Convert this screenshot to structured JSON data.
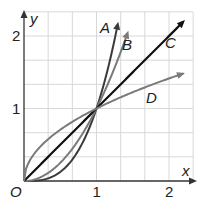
{
  "chart_data": {
    "type": "line",
    "title": "",
    "xlabel": "x",
    "ylabel": "y",
    "origin_label": "O",
    "xlim": [
      0,
      2.3
    ],
    "ylim": [
      0,
      2.33
    ],
    "x_ticks": [
      {
        "value": 1,
        "label": "1"
      },
      {
        "value": 2,
        "label": "2"
      }
    ],
    "y_ticks": [
      {
        "value": 1,
        "label": "1"
      },
      {
        "value": 2,
        "label": "2"
      }
    ],
    "grid": true,
    "grid_step": 0.3333,
    "series": [
      {
        "name": "A",
        "function": "y = x^3",
        "color": "#3a3a3a",
        "x_end": 1.3,
        "points": [
          [
            0,
            0
          ],
          [
            0.5,
            0.125
          ],
          [
            1,
            1
          ],
          [
            1.3,
            2.2
          ]
        ]
      },
      {
        "name": "B",
        "function": "y = x^2",
        "color": "#7a7a7a",
        "x_end": 1.44,
        "points": [
          [
            0,
            0
          ],
          [
            0.5,
            0.25
          ],
          [
            1,
            1
          ],
          [
            1.44,
            2.07
          ]
        ]
      },
      {
        "name": "C",
        "function": "y = x",
        "color": "#111111",
        "x_end": 2.22,
        "points": [
          [
            0,
            0
          ],
          [
            1,
            1
          ],
          [
            2.22,
            2.22
          ]
        ]
      },
      {
        "name": "D",
        "function": "y = sqrt(x)",
        "color": "#7a7a7a",
        "x_end": 2.22,
        "points": [
          [
            0,
            0
          ],
          [
            0.25,
            0.5
          ],
          [
            1,
            1
          ],
          [
            2.22,
            1.49
          ]
        ]
      }
    ],
    "intersection": [
      1,
      1
    ]
  }
}
